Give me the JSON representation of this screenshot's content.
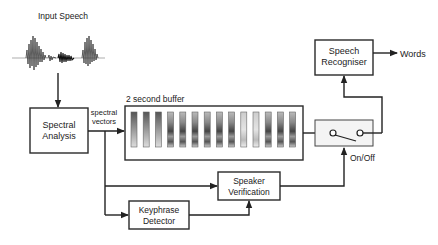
{
  "diagram": {
    "input_label": "Input Speech",
    "spectral_analysis": {
      "line1": "Spectral",
      "line2": "Analysis"
    },
    "spectral_vectors": {
      "line1": "spectral",
      "line2": "vectors"
    },
    "buffer_label": "2 second buffer",
    "buffer_columns": 14,
    "speech_recogniser": {
      "line1": "Speech",
      "line2": "Recogniser"
    },
    "output_label": "Words",
    "switch_label": "On/Off",
    "speaker_verification": {
      "line1": "Speaker",
      "line2": "Verification"
    },
    "keyphrase_detector": {
      "line1": "Keyphrase",
      "line2": "Detector"
    },
    "colors": {
      "stroke": "#222222",
      "background": "#ffffff",
      "switch_fill": "#f4f4f4"
    }
  }
}
